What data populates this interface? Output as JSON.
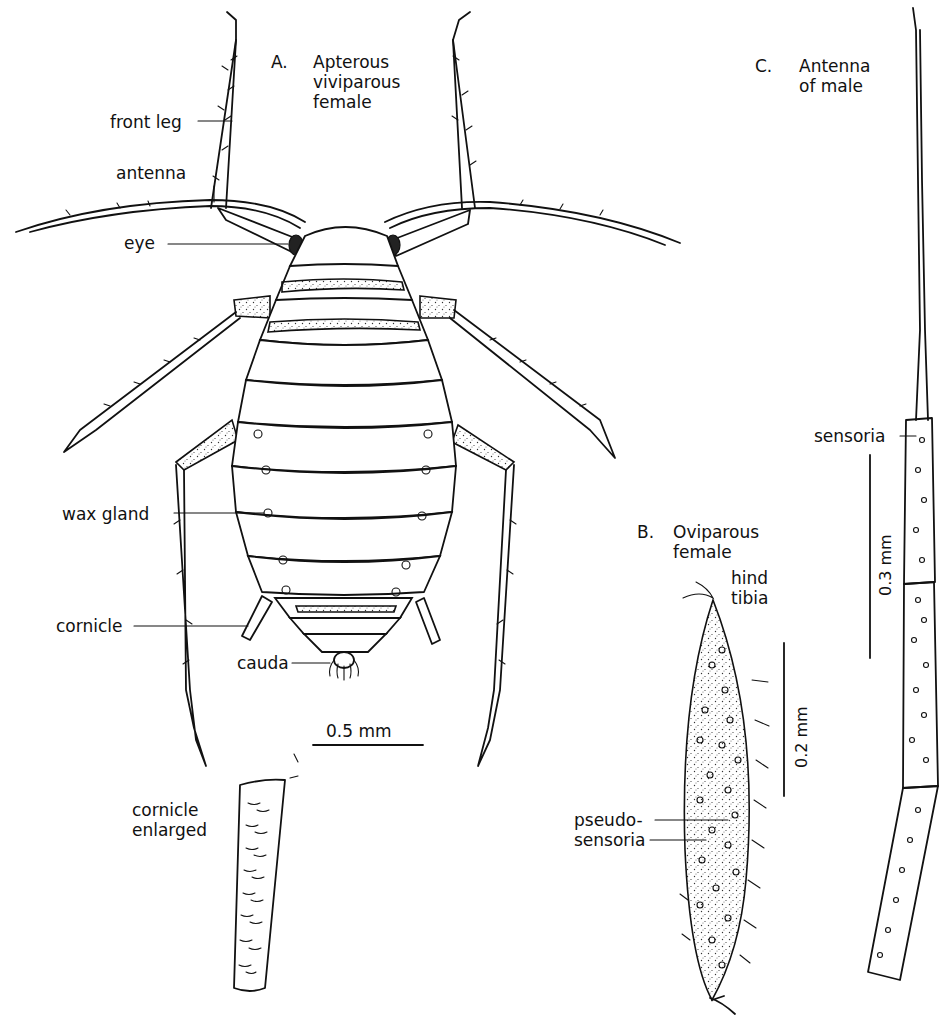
{
  "figure": {
    "panel_a": {
      "letter": "A.",
      "title_lines": [
        "Apterous",
        "viviparous",
        "female"
      ],
      "labels": {
        "front_leg": "front leg",
        "antenna": "antenna",
        "eye": "eye",
        "wax_gland": "wax  gland",
        "cornicle": "cornicle",
        "cauda": "cauda"
      },
      "scale_bar": "0.5 mm"
    },
    "cornicle_detail": {
      "title_lines": [
        "cornicle",
        "enlarged"
      ]
    },
    "panel_b": {
      "letter": "B.",
      "title_lines": [
        "Oviparous",
        "female"
      ],
      "labels": {
        "hind_tibia_lines": [
          "hind",
          "tibia"
        ],
        "pseudo_sensoria_lines": [
          "pseudo-",
          "sensoria"
        ]
      },
      "scale_bar": "0.2 mm"
    },
    "panel_c": {
      "letter": "C.",
      "title_lines": [
        "Antenna",
        "of  male"
      ],
      "labels": {
        "sensoria": "sensoria"
      },
      "scale_bar": "0.3 mm"
    }
  }
}
